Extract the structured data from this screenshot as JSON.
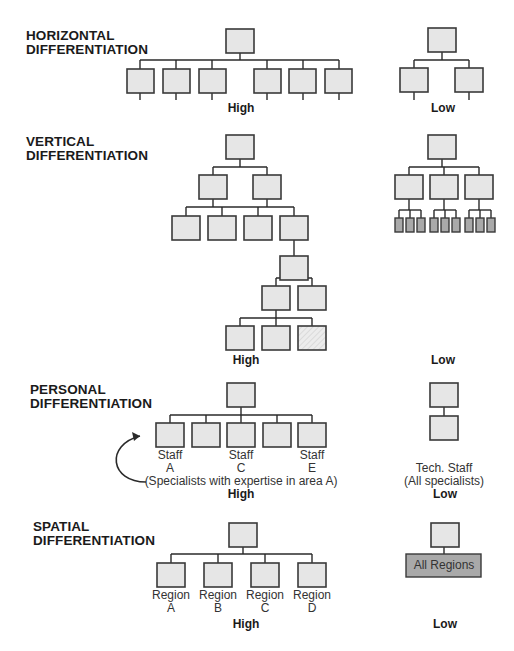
{
  "colors": {
    "box_fill": "#e6e6e6",
    "box_stroke": "#3a3a3a",
    "dark_fill": "#a9a9a9",
    "line": "#2a2a2a",
    "text": "#1a1a1a"
  },
  "sections": [
    {
      "id": "horizontal",
      "title": "HORIZONTAL\nDIFFERENTIATION",
      "title_pos": [
        26,
        29
      ],
      "high_label": "High",
      "high_pos": [
        241,
        101
      ],
      "low_label": "Low",
      "low_pos": [
        443,
        101
      ],
      "boxes": [
        [
          226,
          29,
          28,
          24
        ],
        [
          127,
          69,
          27,
          24
        ],
        [
          163,
          69,
          27,
          24
        ],
        [
          199,
          69,
          27,
          24
        ],
        [
          254,
          69,
          27,
          24
        ],
        [
          289,
          69,
          27,
          24
        ],
        [
          325,
          69,
          27,
          24
        ],
        [
          428,
          28,
          28,
          24
        ],
        [
          400,
          68,
          28,
          24
        ],
        [
          455,
          68,
          28,
          24
        ]
      ],
      "lines": [
        [
          240,
          53,
          240,
          60
        ],
        [
          140,
          60,
          339,
          60
        ],
        [
          140,
          60,
          140,
          69
        ],
        [
          176,
          60,
          176,
          69
        ],
        [
          212,
          60,
          212,
          69
        ],
        [
          267,
          60,
          267,
          69
        ],
        [
          303,
          60,
          303,
          69
        ],
        [
          339,
          60,
          339,
          69
        ],
        [
          140,
          93,
          140,
          100
        ],
        [
          176,
          93,
          176,
          100
        ],
        [
          212,
          93,
          212,
          100
        ],
        [
          267,
          93,
          267,
          100
        ],
        [
          303,
          93,
          303,
          100
        ],
        [
          339,
          93,
          339,
          100
        ],
        [
          442,
          52,
          442,
          60
        ],
        [
          414,
          60,
          469,
          60
        ],
        [
          414,
          60,
          414,
          68
        ],
        [
          469,
          60,
          469,
          68
        ],
        [
          414,
          92,
          414,
          100
        ],
        [
          469,
          92,
          469,
          100
        ]
      ]
    },
    {
      "id": "vertical",
      "title": "VERTICAL\nDIFFERENTIATION",
      "title_pos": [
        26,
        135
      ],
      "high_label": "High",
      "high_pos": [
        246,
        353
      ],
      "low_label": "Low",
      "low_pos": [
        443,
        353
      ],
      "boxes": [
        [
          226,
          135,
          28,
          24
        ],
        [
          199,
          175,
          28,
          24
        ],
        [
          253,
          175,
          28,
          24
        ],
        [
          172,
          216,
          28,
          24
        ],
        [
          208,
          216,
          28,
          24
        ],
        [
          244,
          216,
          28,
          24
        ],
        [
          280,
          216,
          28,
          24
        ],
        [
          280,
          256,
          28,
          24
        ],
        [
          262,
          286,
          28,
          24
        ],
        [
          298,
          286,
          28,
          24
        ],
        [
          226,
          326,
          28,
          24
        ],
        [
          262,
          326,
          28,
          24
        ],
        [
          428,
          135,
          28,
          24
        ],
        [
          395,
          175,
          28,
          24
        ],
        [
          430,
          175,
          28,
          24
        ],
        [
          465,
          175,
          28,
          24
        ]
      ],
      "hatched_boxes": [
        [
          298,
          326,
          28,
          24
        ]
      ],
      "dark_boxes": [
        [
          395,
          218,
          8,
          14
        ],
        [
          406,
          218,
          8,
          14
        ],
        [
          417,
          218,
          8,
          14
        ],
        [
          430,
          218,
          8,
          14
        ],
        [
          441,
          218,
          8,
          14
        ],
        [
          452,
          218,
          8,
          14
        ],
        [
          465,
          218,
          8,
          14
        ],
        [
          476,
          218,
          8,
          14
        ],
        [
          487,
          218,
          8,
          14
        ]
      ],
      "lines": [
        [
          240,
          159,
          240,
          167
        ],
        [
          213,
          167,
          267,
          167
        ],
        [
          213,
          167,
          213,
          175
        ],
        [
          267,
          167,
          267,
          175
        ],
        [
          213,
          199,
          213,
          207
        ],
        [
          267,
          199,
          267,
          207
        ],
        [
          186,
          207,
          294,
          207
        ],
        [
          186,
          207,
          186,
          216
        ],
        [
          222,
          207,
          222,
          216
        ],
        [
          258,
          207,
          258,
          216
        ],
        [
          294,
          207,
          294,
          216
        ],
        [
          294,
          240,
          294,
          256
        ],
        [
          294,
          280,
          294,
          278
        ],
        [
          294,
          280,
          294,
          279
        ],
        [
          294,
          280,
          294,
          278
        ],
        [
          276,
          278,
          312,
          278
        ],
        [
          276,
          278,
          276,
          286
        ],
        [
          312,
          278,
          312,
          286
        ],
        [
          276,
          310,
          276,
          318
        ],
        [
          240,
          318,
          312,
          318
        ],
        [
          240,
          318,
          240,
          326
        ],
        [
          276,
          318,
          276,
          326
        ],
        [
          312,
          318,
          312,
          326
        ],
        [
          442,
          159,
          442,
          167
        ],
        [
          409,
          167,
          479,
          167
        ],
        [
          409,
          167,
          409,
          175
        ],
        [
          444,
          167,
          444,
          175
        ],
        [
          479,
          167,
          479,
          175
        ],
        [
          409,
          199,
          409,
          210
        ],
        [
          399,
          210,
          421,
          210
        ],
        [
          399,
          210,
          399,
          218
        ],
        [
          410,
          210,
          410,
          218
        ],
        [
          421,
          210,
          421,
          218
        ],
        [
          444,
          199,
          444,
          210
        ],
        [
          434,
          210,
          456,
          210
        ],
        [
          434,
          210,
          434,
          218
        ],
        [
          445,
          210,
          445,
          218
        ],
        [
          456,
          210,
          456,
          218
        ],
        [
          479,
          199,
          479,
          210
        ],
        [
          469,
          210,
          491,
          210
        ],
        [
          469,
          210,
          469,
          218
        ],
        [
          480,
          210,
          480,
          218
        ],
        [
          491,
          210,
          491,
          218
        ]
      ]
    },
    {
      "id": "personal",
      "title": "PERSONAL\nDIFFERENTIATION",
      "title_pos": [
        30,
        383
      ],
      "high_label": "High",
      "high_pos": [
        241,
        487
      ],
      "low_label": "Low",
      "low_pos": [
        445,
        487
      ],
      "boxes": [
        [
          227,
          383,
          28,
          24
        ],
        [
          156,
          423,
          28,
          24
        ],
        [
          192,
          423,
          28,
          24
        ],
        [
          227,
          423,
          28,
          24
        ],
        [
          263,
          423,
          28,
          24
        ],
        [
          298,
          423,
          28,
          24
        ],
        [
          430,
          383,
          28,
          24
        ],
        [
          430,
          416,
          28,
          24
        ]
      ],
      "lines": [
        [
          241,
          407,
          241,
          415
        ],
        [
          170,
          415,
          312,
          415
        ],
        [
          170,
          415,
          170,
          423
        ],
        [
          206,
          415,
          206,
          423
        ],
        [
          241,
          415,
          241,
          423
        ],
        [
          277,
          415,
          277,
          423
        ],
        [
          312,
          415,
          312,
          423
        ],
        [
          444,
          407,
          444,
          416
        ]
      ],
      "node_labels": [
        {
          "text": "Staff\nA",
          "pos": [
            170,
            449
          ]
        },
        {
          "text": "Staff\nC",
          "pos": [
            241,
            449
          ]
        },
        {
          "text": "Staff\nE",
          "pos": [
            312,
            449
          ]
        }
      ],
      "note": {
        "text": "(Specialists with expertise in area A)",
        "pos": [
          241,
          475
        ]
      },
      "low_note": {
        "text": "Tech. Staff\n(All specialists)",
        "pos": [
          444,
          462
        ]
      },
      "arrow": {
        "path": "M146,482 C 110,482 105,445 140,436",
        "head": "140,436 132,432 134,441"
      }
    },
    {
      "id": "spatial",
      "title": "SPATIAL\nDIFFERENTIATION",
      "title_pos": [
        33,
        520
      ],
      "high_label": "High",
      "high_pos": [
        246,
        617
      ],
      "low_label": "Low",
      "low_pos": [
        445,
        617
      ],
      "boxes": [
        [
          229,
          523,
          28,
          24
        ],
        [
          157,
          563,
          28,
          24
        ],
        [
          204,
          563,
          28,
          24
        ],
        [
          251,
          563,
          28,
          24
        ],
        [
          298,
          563,
          28,
          24
        ],
        [
          431,
          523,
          28,
          24
        ]
      ],
      "dark_boxes": [
        [
          406,
          554,
          75,
          23
        ]
      ],
      "lines": [
        [
          243,
          547,
          243,
          554
        ],
        [
          171,
          554,
          312,
          554
        ],
        [
          171,
          554,
          171,
          563
        ],
        [
          218,
          554,
          218,
          563
        ],
        [
          265,
          554,
          265,
          563
        ],
        [
          312,
          554,
          312,
          563
        ],
        [
          444,
          547,
          444,
          554
        ]
      ],
      "node_labels": [
        {
          "text": "Region\nA",
          "pos": [
            171,
            589
          ]
        },
        {
          "text": "Region\nB",
          "pos": [
            218,
            589
          ]
        },
        {
          "text": "Region\nC",
          "pos": [
            265,
            589
          ]
        },
        {
          "text": "Region\nD",
          "pos": [
            312,
            589
          ]
        }
      ],
      "dark_box_label": {
        "text": "All Regions",
        "pos": [
          444,
          559
        ]
      }
    }
  ]
}
